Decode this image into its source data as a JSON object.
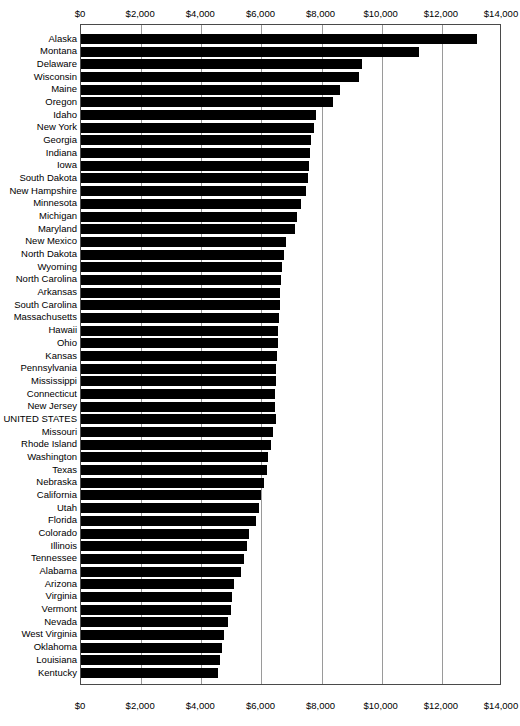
{
  "chart_data": {
    "type": "bar",
    "orientation": "horizontal",
    "title": "",
    "xlabel": "",
    "ylabel": "",
    "xlim": [
      0,
      14000
    ],
    "xticks": [
      0,
      2000,
      4000,
      6000,
      8000,
      10000,
      12000,
      14000
    ],
    "xtick_labels": [
      "$0",
      "$2,000",
      "$4,000",
      "$6,000",
      "$8,000",
      "$10,000",
      "$12,000",
      "$14,000"
    ],
    "grid": true,
    "grid_axis": "x",
    "legend": "none",
    "axis_position": "both-top-and-bottom",
    "bar_color": "#000000",
    "categories": [
      "Alaska",
      "Montana",
      "Delaware",
      "Wisconsin",
      "Maine",
      "Oregon",
      "Idaho",
      "New York",
      "Georgia",
      "Indiana",
      "Iowa",
      "South Dakota",
      "New Hampshire",
      "Minnesota",
      "Michigan",
      "Maryland",
      "New Mexico",
      "North Dakota",
      "Wyoming",
      "North Carolina",
      "Arkansas",
      "South Carolina",
      "Massachusetts",
      "Hawaii",
      "Ohio",
      "Kansas",
      "Pennsylvania",
      "Mississippi",
      "Connecticut",
      "New Jersey",
      "UNITED STATES",
      "Missouri",
      "Rhode Island",
      "Washington",
      "Texas",
      "Nebraska",
      "California",
      "Utah",
      "Florida",
      "Colorado",
      "Illinois",
      "Tennessee",
      "Alabama",
      "Arizona",
      "Virginia",
      "Vermont",
      "Nevada",
      "West Virginia",
      "Oklahoma",
      "Louisiana",
      "Kentucky"
    ],
    "values": [
      13170,
      11240,
      9360,
      9240,
      8620,
      8390,
      7810,
      7740,
      7650,
      7620,
      7580,
      7540,
      7490,
      7300,
      7180,
      7110,
      6820,
      6760,
      6700,
      6650,
      6620,
      6610,
      6600,
      6560,
      6540,
      6520,
      6500,
      6470,
      6460,
      6450,
      6485,
      6400,
      6320,
      6220,
      6170,
      6100,
      5990,
      5920,
      5830,
      5580,
      5510,
      5420,
      5320,
      5080,
      5010,
      4990,
      4890,
      4760,
      4700,
      4610,
      4555
    ],
    "highlight_category": "UNITED STATES"
  }
}
